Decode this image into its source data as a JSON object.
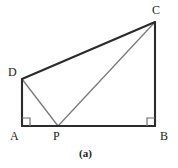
{
  "figure": {
    "caption": "(a)",
    "caption_position": {
      "x": 79,
      "y": 148
    },
    "canvas": {
      "width": 178,
      "height": 168
    },
    "background_color": "#ffffff",
    "outline_color": "#2b2b2b",
    "inner_line_color": "#7a7a7a",
    "right_angle_color": "#6f6f6f",
    "label_color": "#1c1c1c",
    "outline_width": 2.1,
    "inner_line_width": 1.3,
    "right_angle_size": 8,
    "points": {
      "A": {
        "x": 22,
        "y": 126
      },
      "B": {
        "x": 155,
        "y": 126
      },
      "C": {
        "x": 155,
        "y": 22
      },
      "D": {
        "x": 22,
        "y": 79
      },
      "P": {
        "x": 58,
        "y": 126
      }
    },
    "labels": [
      {
        "name": "C",
        "text": "C",
        "x": 152,
        "y": 4
      },
      {
        "name": "D",
        "text": "D",
        "x": 8,
        "y": 66
      },
      {
        "name": "A",
        "text": "A",
        "x": 10,
        "y": 130
      },
      {
        "name": "P",
        "text": "P",
        "x": 53,
        "y": 130
      },
      {
        "name": "B",
        "text": "B",
        "x": 160,
        "y": 130
      }
    ],
    "outline_path": "M 22 126 L 22 79 L 155 22 L 155 126 Z",
    "segments": [
      {
        "name": "segment-AD",
        "from": "A",
        "to": "D",
        "style": "outline"
      },
      {
        "name": "segment-DC",
        "from": "D",
        "to": "C",
        "style": "outline"
      },
      {
        "name": "segment-CB",
        "from": "C",
        "to": "B",
        "style": "outline"
      },
      {
        "name": "segment-AB",
        "from": "A",
        "to": "B",
        "style": "outline"
      },
      {
        "name": "segment-DP",
        "from": "D",
        "to": "P",
        "style": "inner"
      },
      {
        "name": "segment-PC",
        "from": "P",
        "to": "C",
        "style": "inner"
      }
    ],
    "right_angles": [
      {
        "name": "right-angle-A",
        "at": "A",
        "path": "M 22 118 L 30 118 L 30 126"
      },
      {
        "name": "right-angle-B",
        "at": "B",
        "path": "M 155 118 L 147 118 L 147 126"
      }
    ]
  }
}
